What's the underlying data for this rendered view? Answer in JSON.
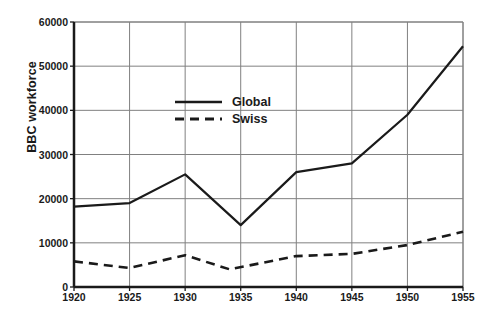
{
  "chart_data": {
    "type": "line",
    "title": "",
    "xlabel": "",
    "ylabel": "BBC workforce",
    "xlim": [
      1920,
      1955
    ],
    "ylim": [
      0,
      60000
    ],
    "grid": true,
    "legend_position": "upper-center-left",
    "x": [
      1920,
      1925,
      1930,
      1935,
      1940,
      1945,
      1950,
      1955
    ],
    "xticks": [
      "1920",
      "1925",
      "1930",
      "1935",
      "1940",
      "1945",
      "1950",
      "1955"
    ],
    "yticks": [
      "0",
      "10000",
      "20000",
      "30000",
      "40000",
      "50000",
      "60000"
    ],
    "ytick_values": [
      0,
      10000,
      20000,
      30000,
      40000,
      50000,
      60000
    ],
    "origin_label": "0",
    "series": [
      {
        "name": "Global",
        "style": "solid",
        "color": "#1a1a1a",
        "x": [
          1920,
          1925,
          1930,
          1935,
          1940,
          1945,
          1950,
          1955
        ],
        "values": [
          18200,
          19000,
          25500,
          14000,
          26000,
          28000,
          39000,
          54500
        ]
      },
      {
        "name": "Swiss",
        "style": "dashed",
        "color": "#1a1a1a",
        "x": [
          1920,
          1925,
          1930,
          1934,
          1940,
          1945,
          1950,
          1955
        ],
        "values": [
          5800,
          4300,
          7200,
          4000,
          7000,
          7500,
          9500,
          12500
        ]
      }
    ],
    "legend": [
      {
        "label": "Global",
        "style": "solid"
      },
      {
        "label": "Swiss",
        "style": "dashed"
      }
    ]
  }
}
